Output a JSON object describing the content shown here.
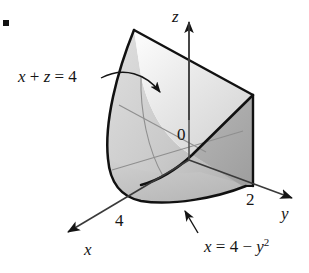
{
  "figure": {
    "kind": "3d-solid-diagram",
    "bullet_marker": "▪",
    "labels": {
      "plane_label": {
        "parts": [
          {
            "text": "x",
            "style": "italic"
          },
          {
            "text": " + ",
            "style": "roman"
          },
          {
            "text": "z",
            "style": "italic"
          },
          {
            "text": " = 4",
            "style": "roman"
          }
        ],
        "plain": "x + z = 4"
      },
      "parabola_label": {
        "parts": [
          {
            "text": "x",
            "style": "italic"
          },
          {
            "text": " = 4 − ",
            "style": "roman"
          },
          {
            "text": "y",
            "style": "italic"
          },
          {
            "text": "2",
            "style": "superscript"
          }
        ],
        "plain": "x = 4 − y²"
      },
      "origin": "0",
      "axis_z": "z",
      "axis_y": "y",
      "axis_x": "x",
      "tick_y_2": "2",
      "tick_x_4": "4"
    },
    "colors": {
      "background": "#ffffff",
      "outline": "#101010",
      "hidden_line": "#8a8a8a",
      "axis": "#4a4a4a",
      "face_top_light": "#f4f4f4",
      "face_top_mid": "#d9d9d9",
      "face_front_light": "#d2d2d2",
      "face_front_dark": "#b2b2b2",
      "face_right_dark": "#a8a8a8",
      "face_bottom": "#c3c3c3",
      "text": "#151515"
    },
    "annotations": {
      "plane_arrow": "curved arrow from plane label into the slanted top face",
      "parabola_arrow": "straight arrow from parabola label up-left to the bottom curved edge"
    }
  }
}
